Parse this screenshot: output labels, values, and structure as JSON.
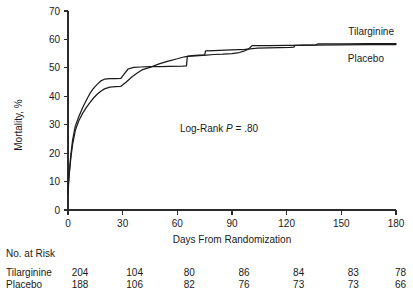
{
  "chart_data": {
    "type": "line",
    "title": "",
    "xlabel": "Days From Randomization",
    "ylabel": "Mortality, %",
    "xlim": [
      0,
      180
    ],
    "ylim": [
      0,
      70
    ],
    "xticks": [
      0,
      30,
      60,
      90,
      120,
      150,
      180
    ],
    "xtick_labels": [
      "0",
      "30",
      "60",
      "90",
      "120",
      "150",
      "180"
    ],
    "yticks": [
      0,
      10,
      20,
      30,
      40,
      50,
      60,
      70
    ],
    "ytick_labels": [
      "0",
      "10",
      "20",
      "30",
      "40",
      "50",
      "60",
      "70"
    ],
    "grid": false,
    "legend_position": "inline-right-end",
    "annotation": "Log-Rank P = .80",
    "annotation_parts": {
      "pre": "Log-Rank ",
      "italic": "P",
      "post": " = .80"
    },
    "series": [
      {
        "name": "Tilarginine",
        "label": "Tilarginine",
        "color": "#1a1a1a",
        "points": [
          [
            0,
            6.0
          ],
          [
            0.6,
            12.0
          ],
          [
            1.5,
            19.0
          ],
          [
            2.5,
            24.5
          ],
          [
            4,
            29.5
          ],
          [
            6,
            33.0
          ],
          [
            8,
            36.0
          ],
          [
            10,
            38.5
          ],
          [
            12,
            41.0
          ],
          [
            14,
            42.8
          ],
          [
            16,
            44.2
          ],
          [
            18,
            45.4
          ],
          [
            20,
            46.0
          ],
          [
            23,
            46.2
          ],
          [
            26,
            46.2
          ],
          [
            29,
            46.3
          ],
          [
            31,
            48.0
          ],
          [
            33,
            49.6
          ],
          [
            36,
            50.2
          ],
          [
            40,
            50.3
          ],
          [
            45,
            50.4
          ],
          [
            50,
            50.4
          ],
          [
            56,
            50.5
          ],
          [
            63,
            50.6
          ],
          [
            65,
            50.7
          ],
          [
            65.5,
            54.0
          ],
          [
            70,
            54.2
          ],
          [
            74,
            54.4
          ],
          [
            76,
            54.5
          ],
          [
            80,
            54.7
          ],
          [
            85,
            54.8
          ],
          [
            90,
            55.0
          ],
          [
            94,
            55.4
          ],
          [
            97,
            56.0
          ],
          [
            99,
            56.6
          ],
          [
            101,
            57.8
          ],
          [
            110,
            57.8
          ],
          [
            120,
            57.9
          ],
          [
            125,
            57.9
          ],
          [
            130,
            58.0
          ],
          [
            136,
            58.1
          ],
          [
            137,
            58.4
          ],
          [
            150,
            58.4
          ],
          [
            165,
            58.5
          ],
          [
            180,
            58.5
          ]
        ]
      },
      {
        "name": "Placebo",
        "label": "Placebo",
        "color": "#1a1a1a",
        "points": [
          [
            0,
            7.5
          ],
          [
            0.6,
            12.5
          ],
          [
            1.5,
            18.0
          ],
          [
            2.5,
            23.0
          ],
          [
            4,
            28.0
          ],
          [
            6,
            31.5
          ],
          [
            8,
            34.0
          ],
          [
            10,
            36.0
          ],
          [
            12,
            37.8
          ],
          [
            14,
            39.4
          ],
          [
            16,
            40.7
          ],
          [
            18,
            41.8
          ],
          [
            20,
            42.6
          ],
          [
            23,
            43.2
          ],
          [
            26,
            43.4
          ],
          [
            29,
            43.5
          ],
          [
            32,
            45.0
          ],
          [
            35,
            46.8
          ],
          [
            38,
            48.2
          ],
          [
            41,
            49.4
          ],
          [
            45,
            50.2
          ],
          [
            50,
            51.4
          ],
          [
            55,
            52.4
          ],
          [
            60,
            53.2
          ],
          [
            64,
            53.9
          ],
          [
            68,
            54.3
          ],
          [
            72,
            54.5
          ],
          [
            75,
            54.6
          ],
          [
            75.5,
            56.0
          ],
          [
            80,
            56.1
          ],
          [
            86,
            56.2
          ],
          [
            90,
            56.3
          ],
          [
            94,
            56.4
          ],
          [
            97,
            56.5
          ],
          [
            100,
            56.7
          ],
          [
            104,
            56.9
          ],
          [
            110,
            57.0
          ],
          [
            116,
            57.1
          ],
          [
            122,
            57.2
          ],
          [
            124,
            57.3
          ],
          [
            124.5,
            57.9
          ],
          [
            135,
            58.0
          ],
          [
            150,
            58.1
          ],
          [
            165,
            58.2
          ],
          [
            180,
            58.2
          ]
        ]
      }
    ],
    "risk_table": {
      "header": "No. at Risk",
      "row_label_column": "",
      "columns": [
        0,
        30,
        60,
        90,
        120,
        150,
        180
      ],
      "rows": [
        {
          "label": "Tilarginine",
          "values": [
            "204",
            "104",
            "80",
            "86",
            "84",
            "83",
            "78"
          ]
        },
        {
          "label": "Placebo",
          "values": [
            "188",
            "106",
            "82",
            "76",
            "73",
            "73",
            "66"
          ]
        }
      ]
    }
  },
  "colors": {
    "axis": "#2b2b2b",
    "text": "#1a1a1a",
    "background": "#ffffff",
    "series": "#1a1a1a"
  }
}
